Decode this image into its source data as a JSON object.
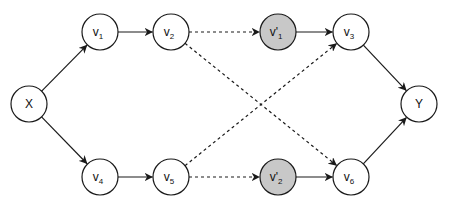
{
  "diagram": {
    "type": "directed-graph",
    "colors": {
      "node_fill": "#ffffff",
      "highlight_fill": "#c8c8c8",
      "stroke": "#1a1a1a",
      "background": "#ffffff"
    },
    "nodes": [
      {
        "id": "X",
        "base": "X",
        "prime": "",
        "sub": "",
        "x": 29,
        "y": 104,
        "highlight": false
      },
      {
        "id": "v1",
        "base": "v",
        "prime": "",
        "sub": "1",
        "x": 100,
        "y": 32,
        "highlight": false
      },
      {
        "id": "v2",
        "base": "v",
        "prime": "",
        "sub": "2",
        "x": 171,
        "y": 32,
        "highlight": false
      },
      {
        "id": "v1p",
        "base": "v",
        "prime": "'",
        "sub": "1",
        "x": 278,
        "y": 32,
        "highlight": true
      },
      {
        "id": "v3",
        "base": "v",
        "prime": "",
        "sub": "3",
        "x": 351,
        "y": 32,
        "highlight": false
      },
      {
        "id": "Y",
        "base": "Y",
        "prime": "",
        "sub": "",
        "x": 419,
        "y": 104,
        "highlight": false
      },
      {
        "id": "v4",
        "base": "v",
        "prime": "",
        "sub": "4",
        "x": 100,
        "y": 177,
        "highlight": false
      },
      {
        "id": "v5",
        "base": "v",
        "prime": "",
        "sub": "5",
        "x": 171,
        "y": 177,
        "highlight": false
      },
      {
        "id": "v2p",
        "base": "v",
        "prime": "'",
        "sub": "2",
        "x": 278,
        "y": 177,
        "highlight": true
      },
      {
        "id": "v6",
        "base": "v",
        "prime": "",
        "sub": "6",
        "x": 351,
        "y": 177,
        "highlight": false
      }
    ],
    "edges": [
      {
        "from": "X",
        "to": "v1",
        "style": "solid"
      },
      {
        "from": "v1",
        "to": "v2",
        "style": "solid"
      },
      {
        "from": "v2",
        "to": "v1p",
        "style": "dashed"
      },
      {
        "from": "v2",
        "to": "v6",
        "style": "dashed"
      },
      {
        "from": "v1p",
        "to": "v3",
        "style": "solid"
      },
      {
        "from": "v3",
        "to": "Y",
        "style": "solid"
      },
      {
        "from": "X",
        "to": "v4",
        "style": "solid"
      },
      {
        "from": "v4",
        "to": "v5",
        "style": "solid"
      },
      {
        "from": "v5",
        "to": "v2p",
        "style": "dashed"
      },
      {
        "from": "v5",
        "to": "v3",
        "style": "dashed"
      },
      {
        "from": "v2p",
        "to": "v6",
        "style": "solid"
      },
      {
        "from": "v6",
        "to": "Y",
        "style": "solid"
      }
    ]
  }
}
